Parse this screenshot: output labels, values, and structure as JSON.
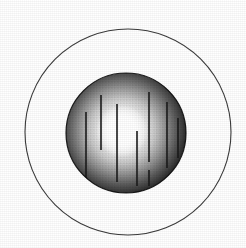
{
  "figure": {
    "title": "Illuminated sphere with vertical streak markings inside outer ring",
    "caption": "",
    "background_color": "#ffffff",
    "canvas": {
      "width": 246,
      "height": 248
    }
  },
  "outer_ring": {
    "label": "outer-ring",
    "center_x": 128,
    "center_y": 132,
    "radius": 103,
    "stroke_color": "#3a3a3a",
    "stroke_width": 1.1,
    "fill": "none"
  },
  "sphere": {
    "label": "shaded-sphere",
    "center_x": 126,
    "center_y": 133,
    "radius": 60,
    "edge_color": "#0a0a0a",
    "mid_color": "#6e6e6e",
    "highlight_color": "#ffffff",
    "rim_stroke_color": "#000000"
  },
  "highlight": {
    "label": "bright-core",
    "center_x": 122,
    "center_y": 131,
    "radius": 26,
    "color": "#ffffff"
  },
  "streaks": {
    "label": "vertical-streak-lines",
    "stroke_color": "#1a1a1a",
    "stroke_width": 1.6,
    "count": 8,
    "lines": [
      {
        "name": "streak-1",
        "x": 86,
        "y1": 112,
        "y2": 180
      },
      {
        "name": "streak-2",
        "x": 101,
        "y1": 95,
        "y2": 150
      },
      {
        "name": "streak-3",
        "x": 117,
        "y1": 104,
        "y2": 182
      },
      {
        "name": "streak-4",
        "x": 137,
        "y1": 131,
        "y2": 186
      },
      {
        "name": "streak-5",
        "x": 149,
        "y1": 92,
        "y2": 162
      },
      {
        "name": "streak-6",
        "x": 149,
        "y1": 170,
        "y2": 186
      },
      {
        "name": "streak-7",
        "x": 167,
        "y1": 102,
        "y2": 168
      },
      {
        "name": "streak-8",
        "x": 178,
        "y1": 118,
        "y2": 158
      }
    ]
  }
}
